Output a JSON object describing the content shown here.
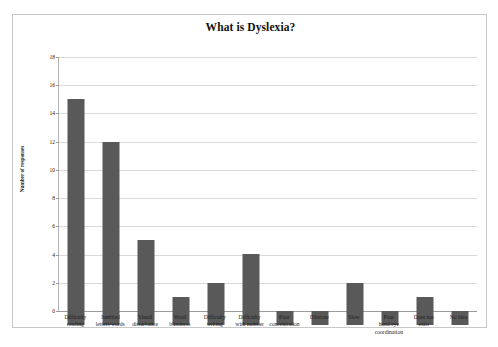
{
  "chart_data": {
    "type": "bar",
    "title": "What is Dyslexia?",
    "xlabel": "",
    "ylabel": "Number of responses",
    "ylim": [
      0,
      18
    ],
    "ytick_step": 2,
    "yticks": [
      0,
      2,
      4,
      6,
      8,
      10,
      12,
      14,
      16,
      18
    ],
    "grid": true,
    "legend": false,
    "legend_position": "none",
    "bar_color": "#595959",
    "gridline_color": "#d9d9d9",
    "categories": [
      "Difficulty reading",
      "Jumbled letters/words",
      "Visual disturbance",
      "Word blindness",
      "Difficulty writing",
      "Difficulty with number",
      "Poor concentration",
      "Illiterate",
      "Slow",
      "Poor hand/eye coordination",
      "Does not exist",
      "No idea"
    ],
    "category_lines": [
      [
        "Difficulty",
        "reading"
      ],
      [
        "Jumbled",
        "letters/words"
      ],
      [
        "Visual",
        "disturbance"
      ],
      [
        "Word",
        "blindness"
      ],
      [
        "Difficulty",
        "writing"
      ],
      [
        "Difficulty",
        "with number"
      ],
      [
        "Poor",
        "concentration"
      ],
      [
        "Illiterate"
      ],
      [
        "Slow"
      ],
      [
        "Poor",
        "hand/eye",
        "coordination"
      ],
      [
        "Does not",
        "exist"
      ],
      [
        "No idea"
      ]
    ],
    "values": [
      16,
      13,
      6,
      2,
      3,
      5,
      1,
      1,
      3,
      1,
      2,
      1
    ]
  }
}
